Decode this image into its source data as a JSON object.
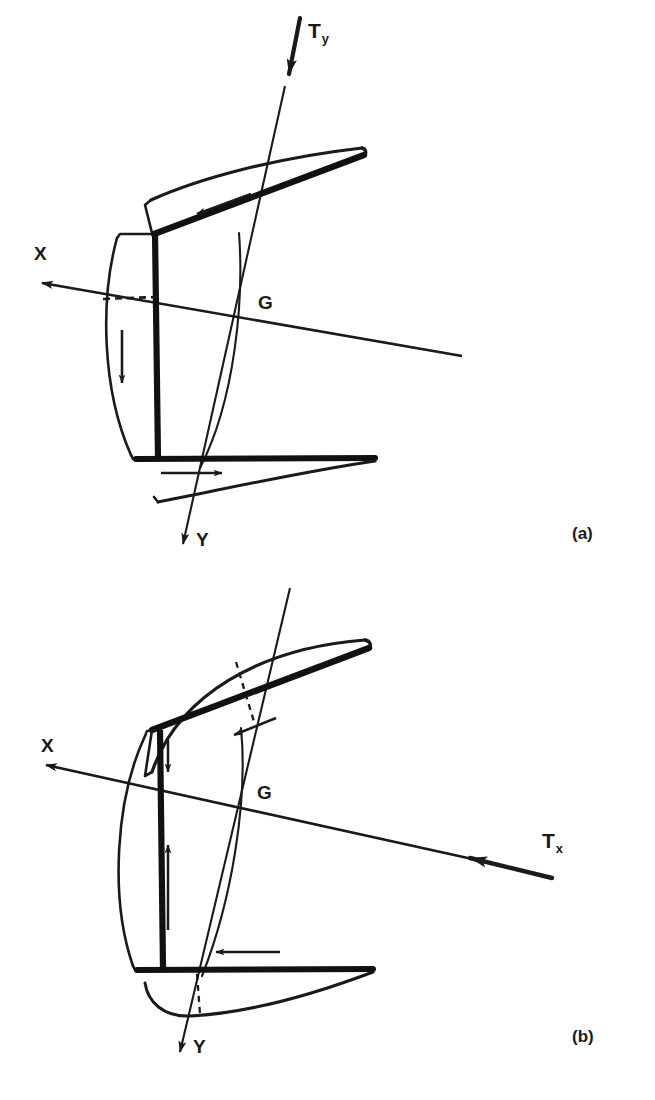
{
  "figure": {
    "kind": "engineering-line-diagram",
    "background_color": "#ffffff",
    "line_color": "#1a1a1a"
  },
  "panels": [
    {
      "id": "a",
      "caption": "(a)",
      "axes": [
        {
          "name": "X",
          "label": "X",
          "direction": "upper-left",
          "arrowhead": true
        },
        {
          "name": "Y",
          "label": "Y",
          "direction": "lower-down",
          "arrowhead": true
        }
      ],
      "points": [
        {
          "name": "G",
          "label": "G",
          "description": "centre of gravity, intersection of X and Y axes"
        }
      ],
      "torque": {
        "label": "T",
        "subscript": "y",
        "full_label": "Ty",
        "direction": "downward along Y axis",
        "arrowhead": true
      },
      "force_arrows": [
        {
          "name": "upper-blade-arrow",
          "direction": "left-down along upper blade chord"
        },
        {
          "name": "hub-arrow",
          "direction": "down along hub centreline"
        },
        {
          "name": "lower-blade-arrow",
          "direction": "right along lower blade chord"
        }
      ],
      "dashed_guides": [
        {
          "name": "x-axis-reference-dash",
          "orientation": "horizontal"
        }
      ]
    },
    {
      "id": "b",
      "caption": "(b)",
      "axes": [
        {
          "name": "X",
          "label": "X",
          "direction": "upper-left",
          "arrowhead": true
        },
        {
          "name": "Y",
          "label": "Y",
          "direction": "lower-down",
          "arrowhead": true
        }
      ],
      "points": [
        {
          "name": "G",
          "label": "G",
          "description": "centre of gravity, intersection of X and Y axes"
        }
      ],
      "torque": {
        "label": "T",
        "subscript": "x",
        "full_label": "Tx",
        "direction": "leftward along X axis",
        "arrowhead": true
      },
      "force_arrows": [
        {
          "name": "upper-blade-arrow",
          "direction": "left-down along upper blade chord"
        },
        {
          "name": "hub-arrow-upper",
          "direction": "down, short, near top of hub"
        },
        {
          "name": "hub-arrow-lower",
          "direction": "up, long, along hub centreline"
        },
        {
          "name": "lower-blade-arrow",
          "direction": "left along lower blade chord"
        }
      ],
      "dashed_guides": [
        {
          "name": "upper-blade-radius-dash",
          "orientation": "diagonal"
        },
        {
          "name": "lower-blade-radius-dash",
          "orientation": "vertical"
        }
      ]
    }
  ],
  "colors": {
    "stroke": "#1a1a1a",
    "thick_stroke": "#111111",
    "background": "#ffffff"
  }
}
